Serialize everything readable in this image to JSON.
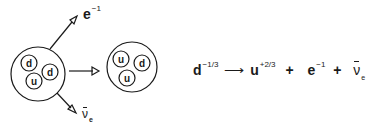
{
  "diagram": {
    "before_particle": {
      "quarks": [
        "d",
        "d",
        "u"
      ]
    },
    "after_particle": {
      "quarks": [
        "u",
        "d",
        "u"
      ]
    },
    "emitted": {
      "electron": {
        "symbol": "e",
        "charge": "−1"
      },
      "antineutrino": {
        "symbol": "ν",
        "subscript": "e"
      }
    }
  },
  "equation": {
    "reactant": {
      "symbol": "d",
      "charge": "−1/3"
    },
    "arrow": "⟶",
    "product_quark": {
      "symbol": "u",
      "charge": "+2/3"
    },
    "plus1": "+",
    "electron": {
      "symbol": "e",
      "charge": "−1"
    },
    "plus2": "+",
    "antineutrino": {
      "symbol": "ν",
      "subscript": "e"
    }
  },
  "colors": {
    "ink": "#1a1a1a",
    "background": "#ffffff"
  }
}
